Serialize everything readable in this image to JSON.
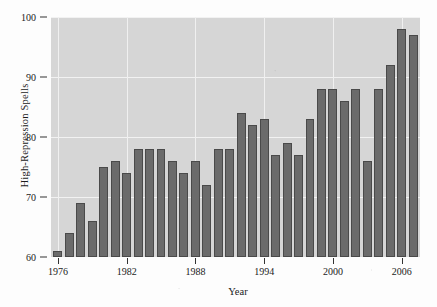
{
  "chart_data": {
    "type": "bar",
    "title": "",
    "subtitle": "",
    "xlabel": "Year",
    "ylabel": "High-Repression Spells",
    "xlim": [
      1975.4,
      2007.6
    ],
    "ylim": [
      60,
      100
    ],
    "grid": true,
    "legend": null,
    "legend_position": "none",
    "yticks": [
      60,
      70,
      80,
      90,
      100
    ],
    "ytick_labels": [
      "60",
      "70",
      "80",
      "90",
      "100"
    ],
    "xticks": [
      1976,
      1982,
      1988,
      1994,
      2000,
      2006
    ],
    "xtick_labels": [
      "1976",
      "1982",
      "1988",
      "1994",
      "2000",
      "2006"
    ],
    "categories": [
      1976,
      1977,
      1978,
      1979,
      1980,
      1981,
      1982,
      1983,
      1984,
      1985,
      1986,
      1987,
      1988,
      1989,
      1990,
      1991,
      1992,
      1993,
      1994,
      1995,
      1996,
      1997,
      1998,
      1999,
      2000,
      2001,
      2002,
      2003,
      2004,
      2005,
      2006,
      2007
    ],
    "values": [
      61,
      64,
      69,
      66,
      75,
      76,
      74,
      78,
      78,
      78,
      76,
      74,
      76,
      72,
      78,
      78,
      84,
      82,
      83,
      77,
      79,
      77,
      83,
      88,
      88,
      86,
      88,
      76,
      88,
      92,
      98,
      97
    ],
    "bar_color": "#6b6b6b",
    "bar_edge_color": "#4a4a4a",
    "plot_background": "#d6d6d6",
    "gridline_color": "#f2f2f2",
    "figure_background": "#fdfdfd",
    "text_color": "#1b1b1b"
  }
}
